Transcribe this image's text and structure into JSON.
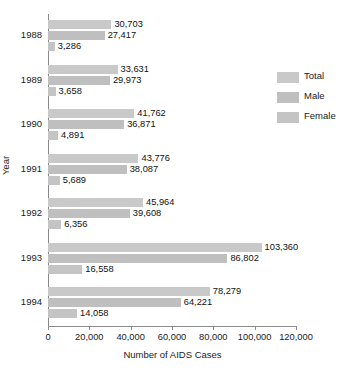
{
  "chart_data": {
    "type": "bar",
    "orientation": "horizontal",
    "title": "",
    "xlabel": "Number of AIDS Cases",
    "ylabel": "Year",
    "categories": [
      "1988",
      "1989",
      "1990",
      "1991",
      "1992",
      "1993",
      "1994"
    ],
    "series": [
      {
        "name": "Total",
        "color": "#c9c9c9",
        "values": [
          30703,
          33631,
          41762,
          43776,
          45964,
          103360,
          78279
        ]
      },
      {
        "name": "Male",
        "color": "#bfbfbf",
        "values": [
          27417,
          29973,
          36871,
          38087,
          39608,
          86802,
          64221
        ]
      },
      {
        "name": "Female",
        "color": "#c4c4c4",
        "values": [
          3286,
          3658,
          4891,
          5689,
          6356,
          16558,
          14058
        ]
      }
    ],
    "value_labels": [
      [
        "30,703",
        "27,417",
        "3,286"
      ],
      [
        "33,631",
        "29,973",
        "3,658"
      ],
      [
        "41,762",
        "36,871",
        "4,891"
      ],
      [
        "43,776",
        "38,087",
        "5,689"
      ],
      [
        "45,964",
        "39,608",
        "6,356"
      ],
      [
        "103,360",
        "86,802",
        "16,558"
      ],
      [
        "78,279",
        "64,221",
        "14,058"
      ]
    ],
    "xlim": [
      0,
      120000
    ],
    "xticks": [
      0,
      20000,
      40000,
      60000,
      80000,
      100000,
      120000
    ],
    "xtick_labels": [
      "0",
      "20,000",
      "40,000",
      "60,000",
      "80,000",
      "100,000",
      "120,000"
    ],
    "grid": false,
    "legend_position": "right"
  },
  "legend": {
    "items": [
      {
        "label": "Total"
      },
      {
        "label": "Male"
      },
      {
        "label": "Female"
      }
    ]
  }
}
